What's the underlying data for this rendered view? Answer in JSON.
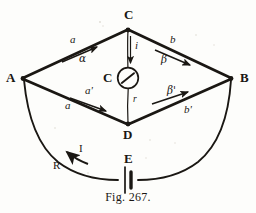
{
  "figure": {
    "caption": "Fig. 267.",
    "background_color": "#fdfdfb",
    "ink_color": "#1a1713"
  },
  "nodes": [
    {
      "id": "A",
      "label": "A",
      "x": 22,
      "y": 78
    },
    {
      "id": "B",
      "label": "B",
      "x": 232,
      "y": 78
    },
    {
      "id": "C",
      "label": "C",
      "x": 128,
      "y": 29
    },
    {
      "id": "D",
      "label": "D",
      "x": 128,
      "y": 124
    }
  ],
  "galvanometer": {
    "label": "C",
    "center_x": 128,
    "center_y": 78,
    "radius": 10
  },
  "battery": {
    "label": "E",
    "x": 128,
    "y": 175
  },
  "branches": [
    {
      "id": "AC",
      "resistance_label": "a",
      "current_label": "α",
      "resistance_x": 73,
      "resistance_y": 41,
      "current_x": 82,
      "current_y": 59
    },
    {
      "id": "CB",
      "resistance_label": "b",
      "current_label": "β",
      "resistance_x": 172,
      "resistance_y": 41,
      "current_x": 164,
      "current_y": 60
    },
    {
      "id": "AD",
      "resistance_label": "a",
      "current_label": "a'",
      "resistance_x": 68,
      "resistance_y": 106,
      "current_x": 88,
      "current_y": 92
    },
    {
      "id": "DB",
      "resistance_label": "b'",
      "current_label": "β'",
      "resistance_x": 186,
      "resistance_y": 110,
      "current_x": 170,
      "current_y": 91
    }
  ],
  "bridge": {
    "top_current_label": "i",
    "bottom_resistance_label": "r",
    "top_current_x": 136,
    "top_current_y": 46,
    "bottom_resistance_x": 135,
    "bottom_resistance_y": 100
  },
  "external_circuit": {
    "current_label": "I",
    "resistance_label": "R",
    "current_x": 75,
    "current_y": 150,
    "resistance_x": 57,
    "resistance_y": 167
  }
}
